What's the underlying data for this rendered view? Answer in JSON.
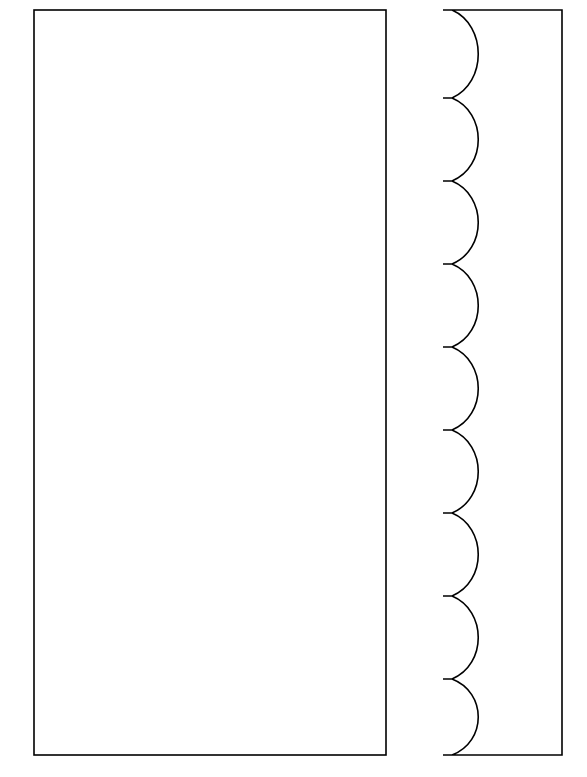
{
  "canvas": {
    "width": 587,
    "height": 777,
    "background_color": "#ffffff",
    "stroke_color": "#000000",
    "fill_color": "#ffffff",
    "stroke_width": 1.6
  },
  "figure": {
    "title": "Scalloped edge pattern pair",
    "shape_count": 2
  },
  "shapes": [
    {
      "name": "plain-rectangle",
      "kind": "rectangle",
      "label": "Left plain rectangle",
      "x": 34,
      "y": 10,
      "width": 352,
      "height": 745,
      "edges": {
        "left": "straight",
        "right": "straight",
        "top": "straight",
        "bottom": "straight"
      }
    },
    {
      "name": "scalloped-panel",
      "kind": "scalloped-rectangle",
      "label": "Right scalloped panel",
      "x": 443,
      "y": 10,
      "width": 119,
      "height": 745,
      "right_edge_x": 562,
      "notch_edge_x": 443,
      "scallop": {
        "count": 9,
        "orientation": "left-edge",
        "profile": "semicircular-concave",
        "radius": 42,
        "depth_px": 44,
        "apex_x": 487,
        "pitch_px": 84,
        "notch_width_px": 9,
        "first_notch_y": 10,
        "notch_y_positions": [
          10,
          98,
          181,
          264,
          347,
          430,
          513,
          596,
          679,
          755
        ]
      },
      "edges": {
        "left": "scalloped",
        "right": "straight",
        "top": "straight",
        "bottom": "straight"
      }
    }
  ]
}
